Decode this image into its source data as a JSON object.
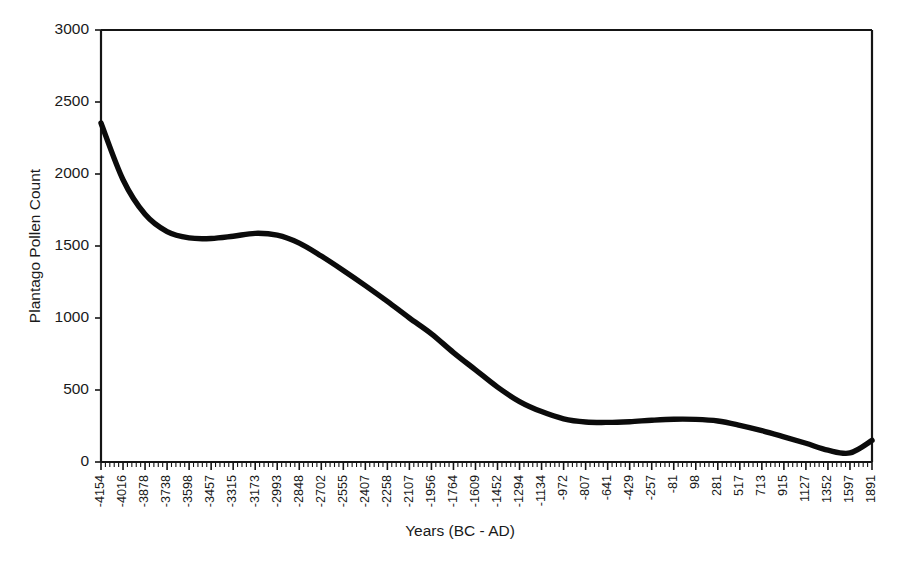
{
  "chart_data": {
    "type": "line",
    "title": "",
    "xlabel": "Years (BC - AD)",
    "ylabel": "Plantago Pollen Count",
    "ylim": [
      0,
      3000
    ],
    "yticks": [
      0,
      500,
      1000,
      1500,
      2000,
      2500,
      3000
    ],
    "ytick_labels": [
      "0",
      "500",
      "1000",
      "1500",
      "2000",
      "2500",
      "3000"
    ],
    "grid": false,
    "legend": "none",
    "minor_ticks_per_major": 4,
    "categories": [
      "-4154",
      "-4016",
      "-3878",
      "-3738",
      "-3598",
      "-3457",
      "-3315",
      "-3173",
      "-2993",
      "-2848",
      "-2702",
      "-2555",
      "-2407",
      "-2258",
      "-2107",
      "-1956",
      "-1764",
      "-1609",
      "-1452",
      "-1294",
      "-1134",
      "-972",
      "-807",
      "-641",
      "-429",
      "-257",
      "-81",
      "98",
      "281",
      "517",
      "713",
      "915",
      "1127",
      "1352",
      "1597",
      "1891"
    ],
    "values": [
      2354,
      1960,
      1720,
      1600,
      1556,
      1552,
      1568,
      1588,
      1575,
      1520,
      1430,
      1330,
      1225,
      1115,
      1000,
      890,
      760,
      640,
      520,
      420,
      350,
      300,
      278,
      275,
      280,
      290,
      297,
      296,
      285,
      255,
      218,
      175,
      130,
      82,
      63,
      150
    ],
    "series_name": "Plantago pollen count",
    "line_color": "#0b0b0b",
    "axis_color": "#151515",
    "background_color": "#ffffff"
  },
  "axes": {
    "x_title": "Years (BC - AD)",
    "y_title": "Plantago Pollen Count"
  }
}
